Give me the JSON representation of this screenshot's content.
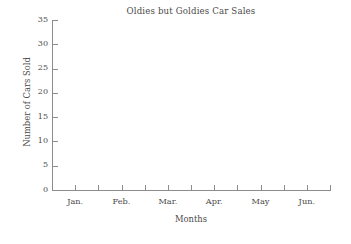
{
  "chart_data": {
    "type": "bar",
    "title": "Oldies but Goldies Car Sales",
    "xlabel": "Months",
    "ylabel": "Number of Cars Sold",
    "categories": [
      "Jan.",
      "Feb.",
      "Mar.",
      "Apr.",
      "May",
      "Jun."
    ],
    "values": [
      null,
      null,
      null,
      null,
      null,
      null
    ],
    "series": [],
    "empty_plot": true,
    "ylim": [
      0,
      35
    ],
    "y_ticks": [
      0,
      5,
      10,
      15,
      20,
      25,
      30,
      35
    ],
    "y_tick_labels": [
      "0",
      "5",
      "10",
      "15",
      "20",
      "25",
      "30",
      "35"
    ],
    "x_tick_count": 13,
    "grid": false,
    "legend": null,
    "axis_color": "#8c8c8c",
    "text_color": "#4a4a4a",
    "background_color": "#ffffff"
  },
  "chart": {
    "title": "Oldies but Goldies Car Sales",
    "x_axis_title": "Months",
    "y_axis_title": "Number of Cars Sold"
  }
}
